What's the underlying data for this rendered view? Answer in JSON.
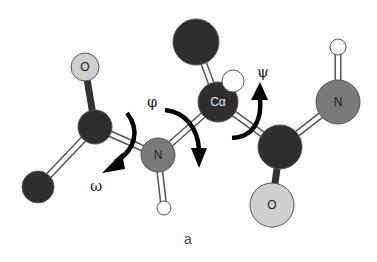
{
  "figure": {
    "panel_label": "a",
    "angle_labels": {
      "phi": "φ",
      "psi": "ψ",
      "omega": "ω"
    },
    "colors": {
      "carbon": "#2e2e2e",
      "nitrogen": "#7a7a7a",
      "oxygen": "#cfcfcf",
      "hydrogen": "#ffffff",
      "outline": "#555555",
      "arrow": "#000000",
      "label_on_dark": "#e6e6e6",
      "label_on_light": "#222222"
    },
    "atoms": [
      {
        "id": "O1",
        "element": "O",
        "label": "O",
        "x": 85,
        "y": 67,
        "r": 14
      },
      {
        "id": "C1",
        "element": "C",
        "label": "",
        "x": 95,
        "y": 127,
        "r": 17
      },
      {
        "id": "C0",
        "element": "C",
        "label": "",
        "x": 38,
        "y": 187,
        "r": 16
      },
      {
        "id": "N1",
        "element": "N",
        "label": "N",
        "x": 158,
        "y": 155,
        "r": 17
      },
      {
        "id": "H1",
        "element": "H",
        "label": "",
        "x": 164,
        "y": 208,
        "r": 7
      },
      {
        "id": "CA",
        "element": "C",
        "label": "Cα",
        "x": 218,
        "y": 102,
        "r": 20
      },
      {
        "id": "CB",
        "element": "C",
        "label": "",
        "x": 196,
        "y": 42,
        "r": 23
      },
      {
        "id": "HA",
        "element": "H",
        "label": "",
        "x": 233,
        "y": 81,
        "r": 11
      },
      {
        "id": "C2",
        "element": "C",
        "label": "",
        "x": 280,
        "y": 147,
        "r": 22
      },
      {
        "id": "O2",
        "element": "O",
        "label": "O",
        "x": 272,
        "y": 205,
        "r": 22
      },
      {
        "id": "N2",
        "element": "N",
        "label": "N",
        "x": 338,
        "y": 102,
        "r": 22
      },
      {
        "id": "H2",
        "element": "H",
        "label": "",
        "x": 338,
        "y": 47,
        "r": 8
      }
    ],
    "bonds": [
      {
        "from": "O1",
        "to": "C1",
        "style": "solid"
      },
      {
        "from": "C1",
        "to": "C0",
        "style": "double"
      },
      {
        "from": "C1",
        "to": "N1",
        "style": "double"
      },
      {
        "from": "N1",
        "to": "H1",
        "style": "double"
      },
      {
        "from": "N1",
        "to": "CA",
        "style": "double"
      },
      {
        "from": "CA",
        "to": "CB",
        "style": "double"
      },
      {
        "from": "CA",
        "to": "C2",
        "style": "double"
      },
      {
        "from": "C2",
        "to": "O2",
        "style": "solid"
      },
      {
        "from": "C2",
        "to": "N2",
        "style": "double"
      },
      {
        "from": "N2",
        "to": "H2",
        "style": "double"
      }
    ]
  }
}
